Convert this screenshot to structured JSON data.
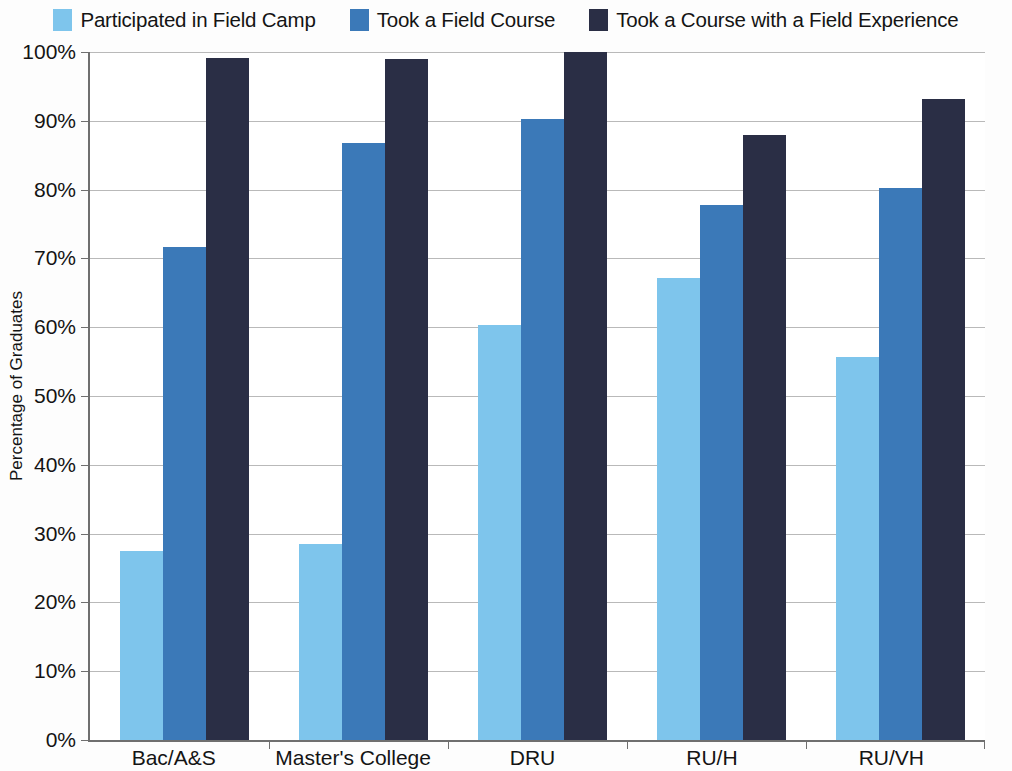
{
  "chart_data": {
    "type": "bar",
    "title": "",
    "subtitle": "",
    "xlabel": "",
    "ylabel": "Percentage of Graduates",
    "categories": [
      "Bac/A&S",
      "Master's College",
      "DRU",
      "RU/H",
      "RU/VH"
    ],
    "series": [
      {
        "name": "Participated in Field Camp",
        "color": "#7EC5EC",
        "values": [
          27.5,
          28.5,
          60.3,
          67.2,
          55.7
        ]
      },
      {
        "name": "Took a Field Course",
        "color": "#3B79B8",
        "values": [
          71.6,
          86.8,
          90.2,
          77.7,
          80.2
        ]
      },
      {
        "name": "Took a Course with a Field Experience",
        "color": "#2A2E45",
        "values": [
          99.1,
          99.0,
          100.0,
          88.0,
          93.2
        ]
      }
    ],
    "ylim": [
      0,
      100
    ],
    "ytick_labels": [
      "100%",
      "90%",
      "80%",
      "70%",
      "60%",
      "50%",
      "40%",
      "30%",
      "20%",
      "10%",
      "0%"
    ],
    "ytick_values": [
      100,
      90,
      80,
      70,
      60,
      50,
      40,
      30,
      20,
      10,
      0
    ],
    "grid": true,
    "legend_position": "top",
    "value_suffix": "%"
  }
}
